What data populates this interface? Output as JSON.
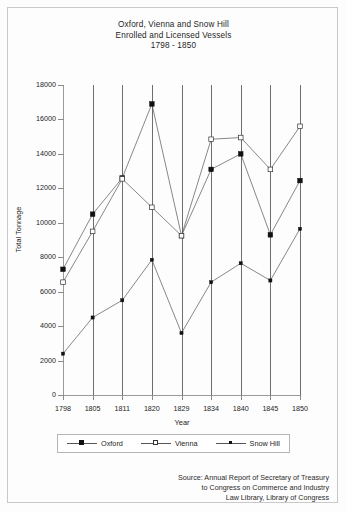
{
  "title": {
    "line1": "Oxford, Vienna and Snow Hill",
    "line2": "Enrolled and Licensed Vessels",
    "line3": "1798 - 1850"
  },
  "axes": {
    "xlabel": "Year",
    "ylabel": "Total Tonnage",
    "yticks": [
      "0",
      "2000",
      "4000",
      "6000",
      "8000",
      "10000",
      "12000",
      "14000",
      "16000",
      "18000"
    ],
    "xticks": [
      "1798",
      "1805",
      "1811",
      "1820",
      "1829",
      "1834",
      "1840",
      "1845",
      "1850"
    ]
  },
  "legend": {
    "items": [
      {
        "label": "Oxford",
        "marker": "filled-square"
      },
      {
        "label": "Vienna",
        "marker": "open-square"
      },
      {
        "label": "Snow Hill",
        "marker": "small-square"
      }
    ]
  },
  "source": {
    "line1": "Source: Annual Report of Secretary of Treasury",
    "line2": "to Congress on Commerce and Industry",
    "line3": "Law Library, Library of Congress"
  },
  "colors": {
    "line": "#555555",
    "marker_fill": "#111111",
    "marker_open": "#ffffff",
    "gridline": "#6e6e6e",
    "axis": "#9a9a9a"
  },
  "chart_data": {
    "type": "line",
    "title": "Oxford, Vienna and Snow Hill Enrolled and Licensed Vessels 1798 - 1850",
    "xlabel": "Year",
    "ylabel": "Total Tonnage",
    "categories": [
      "1798",
      "1805",
      "1811",
      "1820",
      "1829",
      "1834",
      "1840",
      "1845",
      "1850"
    ],
    "ylim": [
      0,
      18000
    ],
    "ytick_step": 2000,
    "grid": "vertical",
    "legend_position": "bottom",
    "series": [
      {
        "name": "Oxford",
        "marker": "filled-square",
        "values": [
          7300,
          10500,
          12600,
          16900,
          9250,
          13100,
          14000,
          9300,
          12450
        ]
      },
      {
        "name": "Vienna",
        "marker": "open-square",
        "values": [
          6550,
          9500,
          12550,
          10900,
          9250,
          14850,
          14950,
          13100,
          15600
        ]
      },
      {
        "name": "Snow Hill",
        "marker": "small-square",
        "values": [
          2400,
          4500,
          5500,
          7850,
          3600,
          6550,
          7650,
          6650,
          9650
        ]
      }
    ]
  }
}
